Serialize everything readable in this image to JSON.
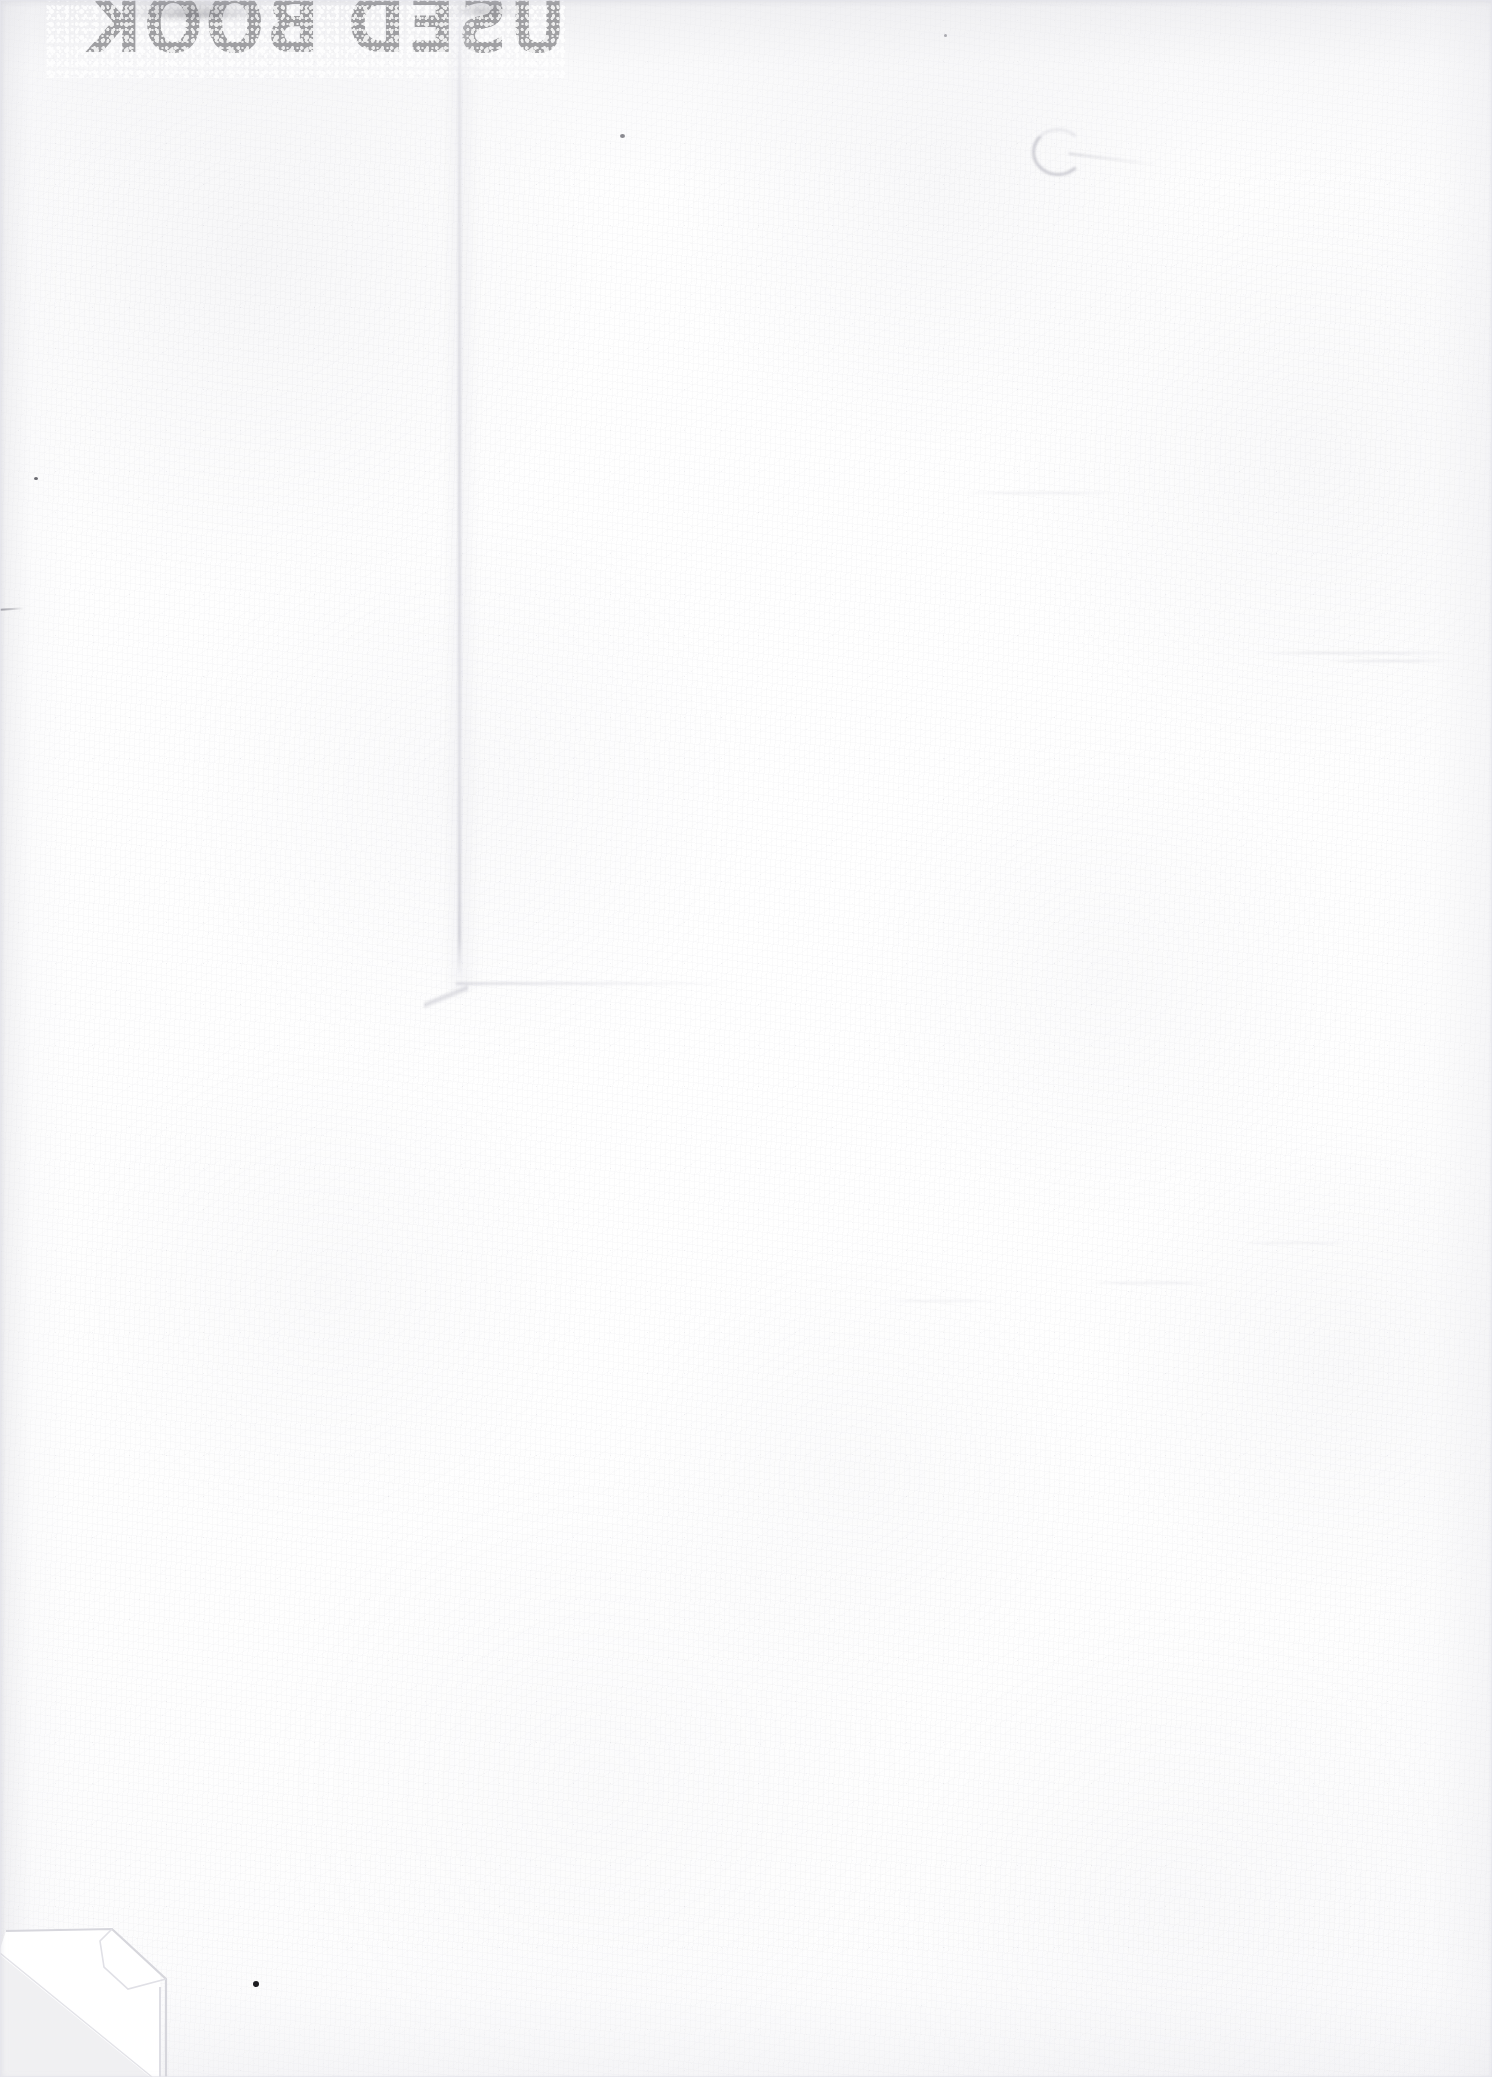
{
  "document": {
    "kind": "scanned-page",
    "description": "Blank endpaper of a used book, scanned",
    "width_px": 1492,
    "height_px": 2077
  },
  "stamp": {
    "text": "USED BOOK",
    "orientation": "mirrored",
    "note": "show-through from reverse side of the page",
    "ink_color": "#3c3c42"
  },
  "paper": {
    "base_color": "#fefefe",
    "tint_color": "#f3f3f5",
    "grain_color": "#cbcbd2",
    "shadow_color": "#e4e4e8"
  },
  "marks": {
    "crease_label": "vertical crease",
    "dogear_label": "folded corner",
    "ink_dot_label": "ink dot",
    "smudge_label": "smudge",
    "crease_color": "#c4c4cd",
    "dogear_color": "#ededf0"
  }
}
